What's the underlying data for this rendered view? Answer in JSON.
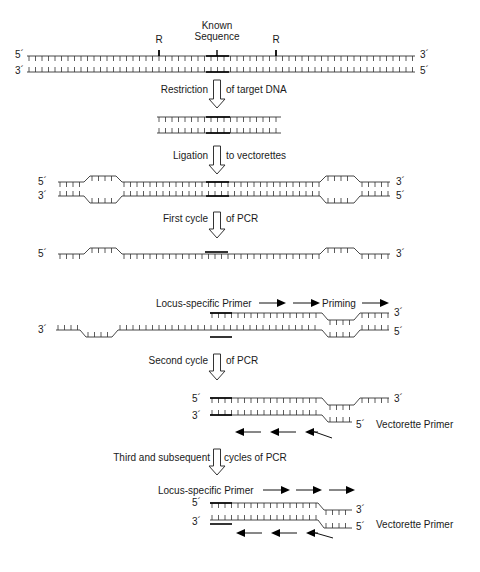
{
  "figure": {
    "top_labels": {
      "known_sequence_line1": "Known",
      "known_sequence_line2": "Sequence",
      "restriction_site_left": "R",
      "restriction_site_right": "R"
    },
    "ends": {
      "five_prime": "5´",
      "three_prime": "3´"
    },
    "steps": {
      "restriction_left": "Restriction",
      "restriction_right": "of target DNA",
      "ligation_left": "Ligation",
      "ligation_right": "to vectorettes",
      "first_cycle_left": "First cycle",
      "first_cycle_right": "of PCR",
      "second_cycle_left": "Second cycle",
      "second_cycle_right": "of PCR",
      "third_cycle_left": "Third and subsequent",
      "third_cycle_right": "cycles of PCR"
    },
    "primers": {
      "locus_specific_1": "Locus-specific Primer",
      "priming": "Priming",
      "vectorette_1": "Vectorette Primer",
      "locus_specific_2": "Locus-specific Primer",
      "vectorette_2": "Vectorette Primer"
    }
  }
}
